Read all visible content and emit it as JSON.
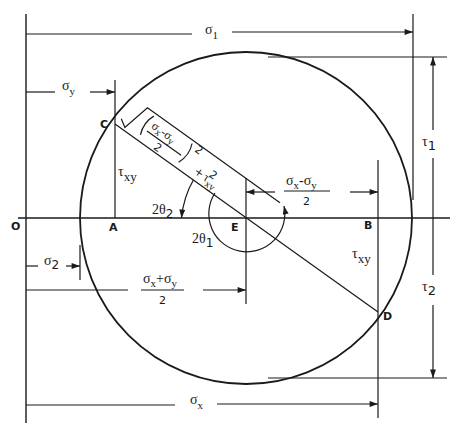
{
  "diagram": {
    "type": "mohr-circle",
    "colors": {
      "line": "#1a1a1a",
      "background": "#ffffff"
    },
    "points": {
      "O": "O",
      "A": "A",
      "B": "B",
      "C": "C",
      "D": "D",
      "E": "E"
    },
    "dimensions": {
      "sigma_1": {
        "sym": "σ",
        "sub": "1"
      },
      "sigma_y": {
        "sym": "σ",
        "sub": "y"
      },
      "sigma_2": {
        "sym": "σ",
        "sub": "2"
      },
      "sigma_x": {
        "sym": "σ",
        "sub": "x"
      },
      "tau_1": {
        "sym": "τ",
        "sub": "1"
      },
      "tau_2": {
        "sym": "τ",
        "sub": "2"
      },
      "tau_xy_left": {
        "sym": "τ",
        "sub": "xy"
      },
      "tau_xy_right": {
        "sym": "τ",
        "sub": "xy"
      },
      "half_diff": {
        "num_a": "σ",
        "sub_a": "x",
        "op": "-",
        "num_b": "σ",
        "sub_b": "y",
        "den": "2"
      },
      "half_sum": {
        "num_a": "σ",
        "sub_a": "x",
        "op": "+",
        "num_b": "σ",
        "sub_b": "y",
        "den": "2"
      }
    },
    "angles": {
      "two_theta_2": {
        "pre": "2θ",
        "sub": "2"
      },
      "two_theta_1": {
        "pre": "2θ",
        "sub": "1"
      }
    },
    "radius_formula": {
      "frac_num_a": "σ",
      "frac_sub_a": "x",
      "frac_op": "-",
      "frac_num_b": "σ",
      "frac_sub_b": "y",
      "frac_den": "2",
      "power": "2",
      "plus": "+",
      "tau": "τ",
      "tau_sub": "xy",
      "tau_power": "2"
    }
  }
}
